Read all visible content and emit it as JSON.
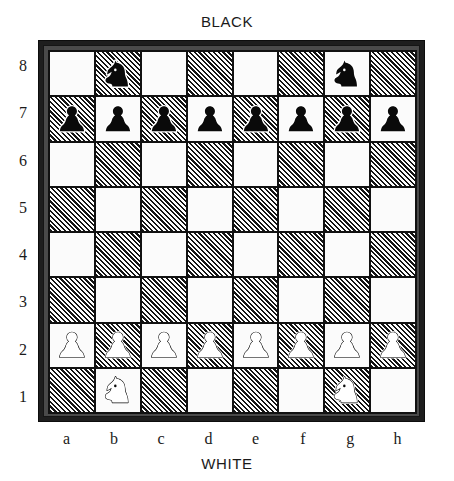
{
  "board": {
    "top_label": "BLACK",
    "bottom_label": "WHITE",
    "rank_labels": [
      "8",
      "7",
      "6",
      "5",
      "4",
      "3",
      "2",
      "1"
    ],
    "file_labels": [
      "a",
      "b",
      "c",
      "d",
      "e",
      "f",
      "g",
      "h"
    ],
    "orientation": "white-at-bottom",
    "light_square_color": "#fbfbfb",
    "dark_square_color": "#141414",
    "dark_square_style": "diagonal-hatch-45",
    "frame_color": "#1e1e1e",
    "squares": [
      {
        "square": "a8",
        "shade": "light",
        "piece": null
      },
      {
        "square": "b8",
        "shade": "dark",
        "piece": "black-knight"
      },
      {
        "square": "c8",
        "shade": "light",
        "piece": null
      },
      {
        "square": "d8",
        "shade": "dark",
        "piece": null
      },
      {
        "square": "e8",
        "shade": "light",
        "piece": null
      },
      {
        "square": "f8",
        "shade": "dark",
        "piece": null
      },
      {
        "square": "g8",
        "shade": "light",
        "piece": "black-knight"
      },
      {
        "square": "h8",
        "shade": "dark",
        "piece": null
      },
      {
        "square": "a7",
        "shade": "dark",
        "piece": "black-pawn"
      },
      {
        "square": "b7",
        "shade": "light",
        "piece": "black-pawn"
      },
      {
        "square": "c7",
        "shade": "dark",
        "piece": "black-pawn"
      },
      {
        "square": "d7",
        "shade": "light",
        "piece": "black-pawn"
      },
      {
        "square": "e7",
        "shade": "dark",
        "piece": "black-pawn"
      },
      {
        "square": "f7",
        "shade": "light",
        "piece": "black-pawn"
      },
      {
        "square": "g7",
        "shade": "dark",
        "piece": "black-pawn"
      },
      {
        "square": "h7",
        "shade": "light",
        "piece": "black-pawn"
      },
      {
        "square": "a6",
        "shade": "light",
        "piece": null
      },
      {
        "square": "b6",
        "shade": "dark",
        "piece": null
      },
      {
        "square": "c6",
        "shade": "light",
        "piece": null
      },
      {
        "square": "d6",
        "shade": "dark",
        "piece": null
      },
      {
        "square": "e6",
        "shade": "light",
        "piece": null
      },
      {
        "square": "f6",
        "shade": "dark",
        "piece": null
      },
      {
        "square": "g6",
        "shade": "light",
        "piece": null
      },
      {
        "square": "h6",
        "shade": "dark",
        "piece": null
      },
      {
        "square": "a5",
        "shade": "dark",
        "piece": null
      },
      {
        "square": "b5",
        "shade": "light",
        "piece": null
      },
      {
        "square": "c5",
        "shade": "dark",
        "piece": null
      },
      {
        "square": "d5",
        "shade": "light",
        "piece": null
      },
      {
        "square": "e5",
        "shade": "dark",
        "piece": null
      },
      {
        "square": "f5",
        "shade": "light",
        "piece": null
      },
      {
        "square": "g5",
        "shade": "dark",
        "piece": null
      },
      {
        "square": "h5",
        "shade": "light",
        "piece": null
      },
      {
        "square": "a4",
        "shade": "light",
        "piece": null
      },
      {
        "square": "b4",
        "shade": "dark",
        "piece": null
      },
      {
        "square": "c4",
        "shade": "light",
        "piece": null
      },
      {
        "square": "d4",
        "shade": "dark",
        "piece": null
      },
      {
        "square": "e4",
        "shade": "light",
        "piece": null
      },
      {
        "square": "f4",
        "shade": "dark",
        "piece": null
      },
      {
        "square": "g4",
        "shade": "light",
        "piece": null
      },
      {
        "square": "h4",
        "shade": "dark",
        "piece": null
      },
      {
        "square": "a3",
        "shade": "dark",
        "piece": null
      },
      {
        "square": "b3",
        "shade": "light",
        "piece": null
      },
      {
        "square": "c3",
        "shade": "dark",
        "piece": null
      },
      {
        "square": "d3",
        "shade": "light",
        "piece": null
      },
      {
        "square": "e3",
        "shade": "dark",
        "piece": null
      },
      {
        "square": "f3",
        "shade": "light",
        "piece": null
      },
      {
        "square": "g3",
        "shade": "dark",
        "piece": null
      },
      {
        "square": "h3",
        "shade": "light",
        "piece": null
      },
      {
        "square": "a2",
        "shade": "light",
        "piece": "white-pawn"
      },
      {
        "square": "b2",
        "shade": "dark",
        "piece": "white-pawn"
      },
      {
        "square": "c2",
        "shade": "light",
        "piece": "white-pawn"
      },
      {
        "square": "d2",
        "shade": "dark",
        "piece": "white-pawn"
      },
      {
        "square": "e2",
        "shade": "light",
        "piece": "white-pawn"
      },
      {
        "square": "f2",
        "shade": "dark",
        "piece": "white-pawn"
      },
      {
        "square": "g2",
        "shade": "light",
        "piece": "white-pawn"
      },
      {
        "square": "h2",
        "shade": "dark",
        "piece": "white-pawn"
      },
      {
        "square": "a1",
        "shade": "dark",
        "piece": null
      },
      {
        "square": "b1",
        "shade": "light",
        "piece": "white-knight"
      },
      {
        "square": "c1",
        "shade": "dark",
        "piece": null
      },
      {
        "square": "d1",
        "shade": "light",
        "piece": null
      },
      {
        "square": "e1",
        "shade": "dark",
        "piece": null
      },
      {
        "square": "f1",
        "shade": "light",
        "piece": null
      },
      {
        "square": "g1",
        "shade": "dark",
        "piece": "white-knight"
      },
      {
        "square": "h1",
        "shade": "light",
        "piece": null
      }
    ]
  }
}
